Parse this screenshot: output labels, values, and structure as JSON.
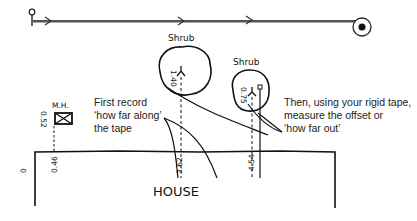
{
  "diagram": {
    "tape": {
      "start_icon": "tape-anchor-peg",
      "end_icon": "tape-reel"
    },
    "labels": {
      "shrub1": "Shrub",
      "shrub2": "Shrub",
      "manhole": "M.H.",
      "house": "HOUSE"
    },
    "measurements": {
      "origin": "0",
      "mh_along": "0.46",
      "mh_out": "0.52",
      "shrub1_along": "3.62",
      "shrub1_out": "1.40",
      "shrub2_along": "4.54",
      "shrub2_out": "0.75"
    },
    "notes": {
      "first": [
        "First record",
        "‘how far along’",
        "the tape"
      ],
      "then": [
        "Then, using your rigid tape,",
        "measure the offset or",
        "‘how far out’"
      ]
    }
  }
}
